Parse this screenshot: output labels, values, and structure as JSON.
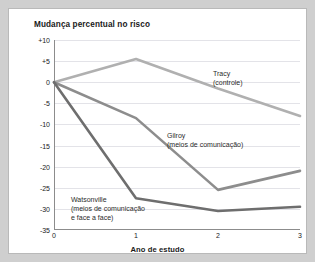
{
  "figure": {
    "title": "Mudança percentual no risco",
    "xaxis_title": "Ano de estudo"
  },
  "annotations": {
    "tracy": {
      "line1": "Tracy",
      "line2": "(controle)"
    },
    "gilroy": {
      "line1": "Gilroy",
      "line2": "(meios de comunicação)"
    },
    "watsonville": {
      "line1": "Watsonville",
      "line2": "(meios de comunicação",
      "line3": "e face a face)"
    }
  },
  "chart_data": {
    "type": "line",
    "title": "Mudança percentual no risco",
    "xlabel": "Ano de estudo",
    "ylabel": "Mudança percentual no risco",
    "x": [
      0,
      1,
      2,
      3
    ],
    "xtick_labels": [
      "0",
      "1",
      "2",
      "3"
    ],
    "xlim": [
      0,
      3
    ],
    "ylim": [
      -35,
      10
    ],
    "ytick_labels": [
      "+10",
      "+5",
      "0",
      "-5",
      "-10",
      "-15",
      "-20",
      "-25",
      "-30",
      "-35"
    ],
    "ytick_values": [
      10,
      5,
      0,
      -5,
      -10,
      -15,
      -20,
      -25,
      -30,
      -35
    ],
    "grid": true,
    "legend": "inline-annotations",
    "series": [
      {
        "name": "Tracy (controle)",
        "label_short": "Tracy",
        "color": "#b0b0b0",
        "values": [
          0,
          5.5,
          -1.5,
          -8
        ]
      },
      {
        "name": "Gilroy (meios de comunicação)",
        "label_short": "Gilroy",
        "color": "#8d8d8d",
        "values": [
          0,
          -8.5,
          -25.5,
          -21
        ]
      },
      {
        "name": "Watsonville (meios de comunicação e face a face)",
        "label_short": "Watsonville",
        "color": "#6e6e6e",
        "values": [
          0,
          -27.5,
          -30.5,
          -29.5
        ]
      }
    ]
  }
}
